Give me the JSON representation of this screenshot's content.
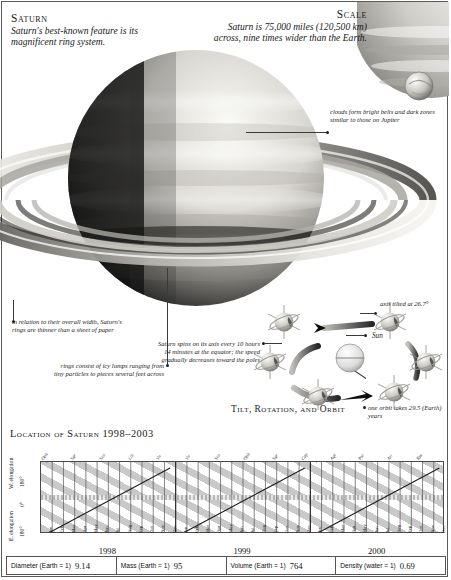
{
  "title_block": {
    "heading": "Saturn",
    "text": "Saturn's best-known feature is its magnificent ring system."
  },
  "scale_block": {
    "heading": "Scale",
    "text": "Saturn is 75,000 miles (120,500 km) across, nine times wider than the Earth."
  },
  "annotations": {
    "clouds": "clouds form bright belts and dark zones similar to those on Jupiter",
    "thin_rings": "in relation to their overall width, Saturn's rings are thinner than a sheet of paper",
    "icy_lumps": "rings consist of icy lumps ranging from tiny particles to pieces several feet across",
    "spin": "Saturn spins on its axis every 10 hours 14 minutes at the equator; the speed gradually decreases toward the poles",
    "tilt": "axis tilted at 26.7°",
    "orbit": "one orbit takes 29.5 (Earth) years",
    "sun": "Sun"
  },
  "tilt_section": {
    "title": "Tilt, Rotation, and Orbit"
  },
  "chart_data": {
    "type": "line",
    "title": "Location of Saturn 1998–2003",
    "xlabel": "",
    "ylabel": "elongation",
    "y_axis_labels": [
      "W. elongation",
      "180°",
      "0°",
      "E. elongation",
      "180°"
    ],
    "ylim": [
      -180,
      180
    ],
    "grid": false,
    "legend": "none",
    "years": [
      "1998",
      "1999",
      "2000"
    ],
    "months": [
      "Jan",
      "Feb",
      "Mar",
      "Apr",
      "May",
      "Jun",
      "Jul",
      "Aug",
      "Sep",
      "Oct",
      "Nov",
      "Dec"
    ],
    "top_labels": [
      "Oph",
      "Sgr",
      "Sco",
      "Lib",
      "Vir",
      "Vir",
      "Sco",
      "Oph",
      "Sgr",
      "Cap",
      "Aqr",
      "Psc",
      "Ari",
      "Tau"
    ],
    "x": [
      "1998-01",
      "1998-02",
      "1998-03",
      "1998-04",
      "1998-05",
      "1998-06",
      "1998-07",
      "1998-08",
      "1998-09",
      "1998-10",
      "1998-11",
      "1998-12",
      "1999-01",
      "1999-02",
      "1999-03",
      "1999-04",
      "1999-05",
      "1999-06",
      "1999-07",
      "1999-08",
      "1999-09",
      "1999-10",
      "1999-11",
      "1999-12",
      "2000-01",
      "2000-02",
      "2000-03",
      "2000-04",
      "2000-05",
      "2000-06",
      "2000-07",
      "2000-08",
      "2000-09",
      "2000-10",
      "2000-11",
      "2000-12"
    ],
    "series": [
      {
        "name": "elongation",
        "values": [
          -180,
          -150,
          -120,
          -90,
          -60,
          -30,
          0,
          30,
          60,
          90,
          120,
          150,
          -180,
          -150,
          -120,
          -90,
          -60,
          -30,
          0,
          30,
          60,
          90,
          120,
          150,
          -180,
          -150,
          -120,
          -90,
          -60,
          -30,
          0,
          30,
          60,
          90,
          120,
          150
        ]
      }
    ]
  },
  "stats": [
    {
      "label": "Diameter (Earth = 1)",
      "value": "9.14"
    },
    {
      "label": "Mass (Earth = 1)",
      "value": "95"
    },
    {
      "label": "Volume (Earth = 1)",
      "value": "764"
    },
    {
      "label": "Density (water = 1)",
      "value": "0.69"
    }
  ]
}
